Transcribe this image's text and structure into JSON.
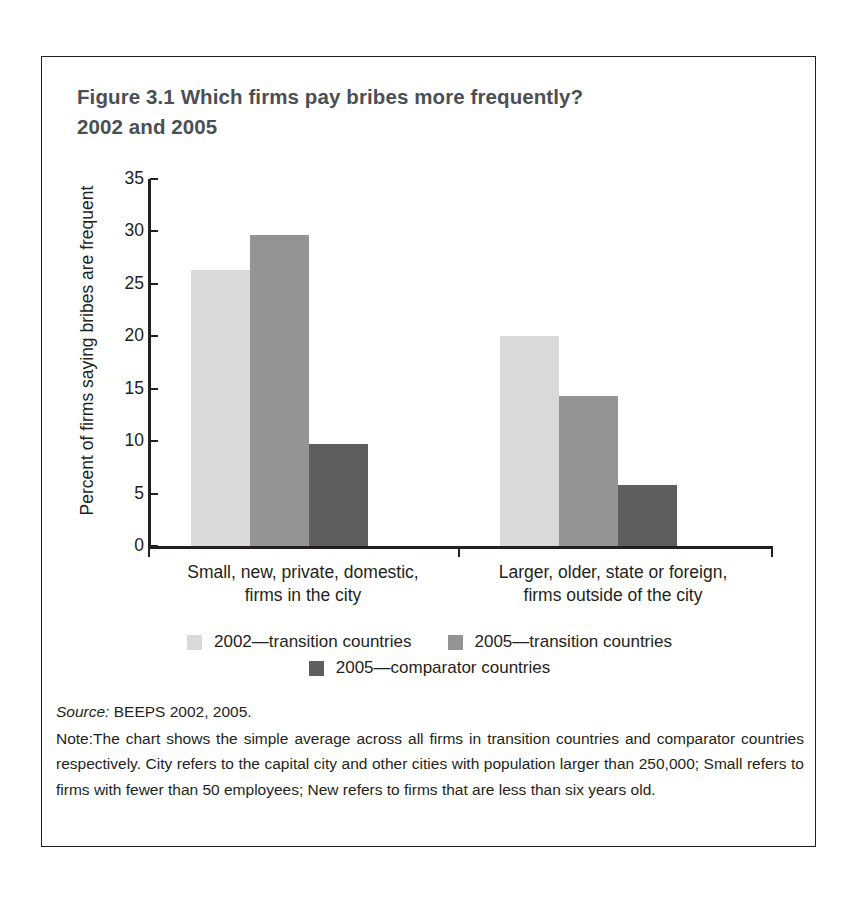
{
  "figure": {
    "title_line1": "Figure 3.1  Which firms pay bribes more frequently?",
    "title_line2": "2002 and 2005"
  },
  "source": {
    "label": "Source:",
    "text": " BEEPS 2002, 2005."
  },
  "note": {
    "label": "Note:",
    "text": "The chart shows the simple average across all firms in transition countries and comparator countries respectively. City refers to the capital city and other cities with population larger than 250,000; Small refers to firms with fewer than 50 employees; New refers to firms that are less than six years old."
  },
  "legend": {
    "items": [
      {
        "label": "2002—transition countries",
        "color": "#d9d9d9"
      },
      {
        "label": "2005—transition countries",
        "color": "#949494"
      },
      {
        "label": "2005—comparator countries",
        "color": "#5e5e5e"
      }
    ]
  },
  "chart_data": {
    "type": "bar",
    "title": "Figure 3.1  Which firms pay bribes more frequently? 2002 and 2005",
    "xlabel": "",
    "ylabel": "Percent of firms saying bribes are frequent",
    "ylim": [
      0,
      35
    ],
    "yticks": [
      0,
      5,
      10,
      15,
      20,
      25,
      30,
      35
    ],
    "ytick_labels": [
      "0",
      "5",
      "10",
      "15",
      "20",
      "25",
      "30",
      "35"
    ],
    "grid": false,
    "legend_position": "bottom",
    "categories": [
      "Small, new, private, domestic, firms in the city",
      "Larger, older, state or foreign, firms outside of the city"
    ],
    "category_lines": [
      [
        "Small, new, private, domestic,",
        "firms in the city"
      ],
      [
        "Larger, older, state or foreign,",
        "firms outside of the city"
      ]
    ],
    "series": [
      {
        "name": "2002—transition countries",
        "color": "#d9d9d9",
        "values": [
          26.3,
          20.0
        ]
      },
      {
        "name": "2005—transition countries",
        "color": "#949494",
        "values": [
          29.7,
          14.3
        ]
      },
      {
        "name": "2005—comparator countries",
        "color": "#5e5e5e",
        "values": [
          9.7,
          5.8
        ]
      }
    ]
  }
}
